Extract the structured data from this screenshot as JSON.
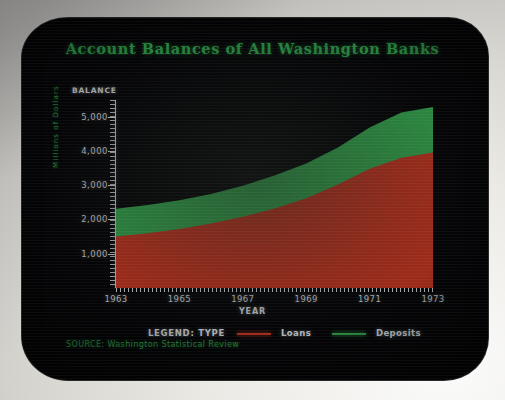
{
  "screen": {
    "title": "Account Balances of All Washington Banks",
    "balance_header": "BALANCE",
    "source_text": "SOURCE: Washington Statistical Review",
    "legend_title": "LEGEND: TYPE"
  },
  "colors": {
    "loans": "#c4341f",
    "deposits": "#35a84e",
    "title_green": "#2ea04a",
    "axis_text": "#ccd0d4",
    "screen_bg": "#040406",
    "bezel": "#e8e6e1"
  },
  "chart_data": {
    "type": "area",
    "stacked": true,
    "title": "Account Balances of All Washington Banks",
    "xlabel": "YEAR",
    "ylabel": "Millions of Dollars",
    "y_axis_header": "BALANCE",
    "grid": false,
    "legend_position": "bottom",
    "legend_title": "LEGEND: TYPE",
    "source": "SOURCE: Washington Statistical Review",
    "x": [
      1963,
      1964,
      1965,
      1966,
      1967,
      1968,
      1969,
      1970,
      1971,
      1972,
      1973
    ],
    "xlim": [
      1963,
      1973
    ],
    "ylim": [
      0,
      5600
    ],
    "xticks": [
      "1963",
      "1965",
      "1967",
      "1969",
      "1971",
      "1973"
    ],
    "xtick_values": [
      1963,
      1965,
      1967,
      1969,
      1971,
      1973
    ],
    "yticks": [
      "1,000",
      "2,000",
      "3,000",
      "4,000",
      "5,000"
    ],
    "ytick_values": [
      1000,
      2000,
      3000,
      4000,
      5000
    ],
    "series": [
      {
        "name": "Loans",
        "color": "#c4341f",
        "values": [
          1500,
          1600,
          1720,
          1880,
          2080,
          2320,
          2620,
          3020,
          3480,
          3800,
          3950
        ]
      },
      {
        "name": "Deposits",
        "color": "#35a84e",
        "values": [
          810,
          820,
          840,
          860,
          900,
          960,
          1010,
          1080,
          1200,
          1320,
          1330
        ]
      }
    ],
    "totals": [
      2310,
      2420,
      2560,
      2740,
      2980,
      3280,
      3630,
      4100,
      4680,
      5120,
      5280
    ]
  },
  "legend_items": [
    {
      "label": "Loans",
      "color": "#c4341f"
    },
    {
      "label": "Deposits",
      "color": "#35a84e"
    }
  ]
}
